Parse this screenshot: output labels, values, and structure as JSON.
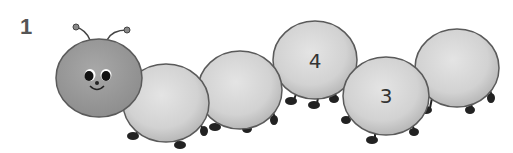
{
  "exercise": {
    "number": "1"
  },
  "caterpillar": {
    "head": {
      "color": "#9c9c9c",
      "face": "smiling"
    },
    "segments": [
      {
        "index": 1,
        "number": ""
      },
      {
        "index": 2,
        "number": ""
      },
      {
        "index": 3,
        "number": "4"
      },
      {
        "index": 4,
        "number": "3"
      },
      {
        "index": 5,
        "number": ""
      }
    ],
    "segment_color": "#d6d6d6",
    "outline_color": "#5a5a5a"
  }
}
